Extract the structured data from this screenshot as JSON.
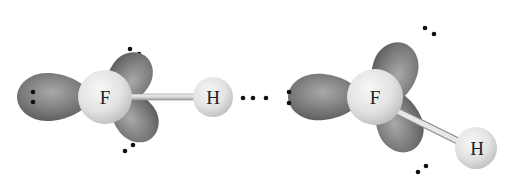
{
  "diagram": {
    "molecules": [
      {
        "id": "hf-left",
        "atoms": [
          {
            "symbol": "F",
            "x": 105,
            "y": 97,
            "r": 27
          },
          {
            "symbol": "H",
            "x": 213,
            "y": 97,
            "r": 20
          }
        ],
        "lone_pairs": 3
      },
      {
        "id": "hf-right",
        "atoms": [
          {
            "symbol": "F",
            "x": 375,
            "y": 97,
            "r": 28
          },
          {
            "symbol": "H",
            "x": 476,
            "y": 148,
            "r": 21
          }
        ],
        "lone_pairs": 3
      }
    ],
    "hydrogen_bond_symbol": "···",
    "labels": {
      "left_f": "F",
      "left_h": "H",
      "right_f": "F",
      "right_h": "H"
    },
    "colors": {
      "lobe": "#6b6b6b",
      "lobe_light": "#a6a6a6",
      "atom": "#e4e4e4",
      "atom_shadow": "#b9b9b9",
      "bond": "#d8d8d8",
      "electron": "#111111"
    }
  }
}
